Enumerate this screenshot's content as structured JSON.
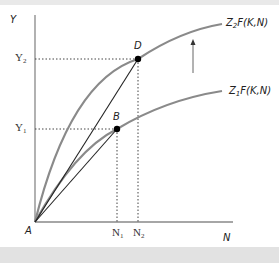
{
  "diagram": {
    "axes": {
      "y_label": "Y",
      "x_label": "N",
      "origin_label": "A"
    },
    "y_ticks": [
      {
        "label": "Y",
        "sub": "2"
      },
      {
        "label": "Y",
        "sub": "1"
      }
    ],
    "x_ticks": [
      {
        "label": "N",
        "sub": "1"
      },
      {
        "label": "N",
        "sub": "2"
      }
    ],
    "points": [
      {
        "label": "D"
      },
      {
        "label": "B"
      }
    ],
    "curves": [
      {
        "label_prefix": "Z",
        "sub": "2",
        "label_suffix": "F(K,N)"
      },
      {
        "label_prefix": "Z",
        "sub": "1",
        "label_suffix": "F(K,N)"
      }
    ],
    "colors": {
      "curve": "#8a8a8a",
      "line": "#222222",
      "axis": "#888888"
    }
  }
}
